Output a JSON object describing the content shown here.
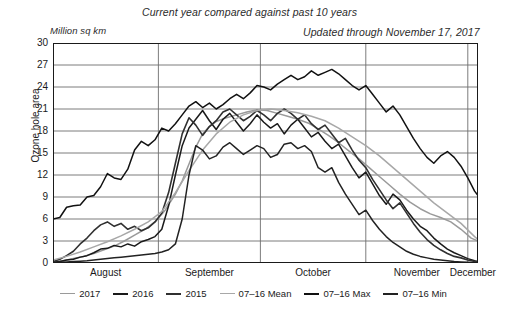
{
  "header": {
    "title": "Current year compared against past 10 years",
    "updated": "Updated through November 17, 2017",
    "unit": "Million sq km"
  },
  "axis": {
    "ylabel": "Ozone hole area",
    "yticks": [
      "30",
      "27",
      "24",
      "21",
      "18",
      "15",
      "12",
      "9",
      "6",
      "3",
      "0"
    ],
    "xticks": [
      "August",
      "September",
      "October",
      "November",
      "December"
    ]
  },
  "colors": {
    "c2017": "#9a9a9a",
    "c2016": "#1a1a1a",
    "c2015": "#303030",
    "cmean": "#a8a8a8",
    "cmax": "#111111",
    "cmin": "#222222",
    "grid": "#6e6e6e",
    "frame": "#1a1a1a"
  },
  "chart_data": {
    "type": "line",
    "title": "Current year compared against past 10 years",
    "subtitle": "Updated through November 17, 2017",
    "xlabel": "",
    "ylabel": "Ozone hole area",
    "yunit": "Million sq km",
    "ylim": [
      0,
      30
    ],
    "ytick_step": 3,
    "grid": true,
    "legend_position": "bottom",
    "x_axis_type": "day-of-year",
    "xlim": [
      0,
      125
    ],
    "month_boundaries": [
      0,
      31,
      61,
      92,
      122
    ],
    "month_labels": [
      "August",
      "September",
      "October",
      "November",
      "December"
    ],
    "series": [
      {
        "name": "2017",
        "color": "#9a9a9a",
        "x": [
          0,
          3,
          6,
          9,
          12,
          15,
          18,
          21,
          24,
          27,
          30,
          33,
          36,
          38,
          40,
          42,
          44,
          46,
          48,
          51,
          54,
          57,
          60,
          63,
          66,
          69,
          72,
          75,
          78,
          81,
          84,
          87,
          90,
          93,
          96,
          99,
          102,
          105,
          108,
          111,
          114,
          117,
          120,
          123,
          125
        ],
        "values": [
          0.2,
          0.3,
          0.6,
          0.9,
          1.3,
          1.8,
          2.3,
          3.0,
          3.8,
          4.6,
          5.6,
          7.2,
          9.4,
          11.2,
          13.5,
          15.8,
          17.6,
          18.6,
          19.3,
          19.8,
          20.2,
          20.6,
          20.9,
          20.8,
          20.4,
          20.0,
          19.6,
          19.1,
          18.3,
          17.4,
          16.4,
          15.3,
          14.2,
          13.0,
          11.8,
          10.6,
          9.4,
          8.3,
          7.4,
          6.7,
          6.2,
          5.6,
          4.6,
          3.4,
          3.0
        ]
      },
      {
        "name": "2016",
        "color": "#1a1a1a",
        "x": [
          0,
          2,
          4,
          6,
          8,
          10,
          12,
          14,
          16,
          18,
          20,
          22,
          24,
          26,
          28,
          30,
          32,
          34,
          36,
          38,
          40,
          42,
          44,
          46,
          48,
          50,
          52,
          54,
          56,
          58,
          60,
          62,
          64,
          66,
          68,
          70,
          72,
          74,
          76,
          78,
          80,
          82,
          84,
          86,
          88,
          90,
          92,
          94,
          96,
          98,
          100,
          102,
          104,
          106,
          108,
          110,
          112,
          114,
          116,
          118,
          120,
          122,
          124,
          125
        ],
        "values": [
          0.1,
          0.2,
          0.4,
          0.5,
          0.8,
          1.0,
          1.4,
          1.9,
          2.0,
          2.4,
          2.2,
          2.6,
          2.3,
          2.9,
          3.2,
          3.6,
          4.6,
          7.8,
          12.0,
          16.0,
          18.4,
          19.6,
          20.8,
          19.4,
          18.2,
          19.6,
          20.4,
          19.2,
          18.0,
          19.0,
          20.2,
          19.2,
          18.4,
          19.0,
          17.6,
          18.8,
          19.6,
          18.4,
          17.2,
          17.8,
          16.6,
          15.6,
          16.2,
          14.6,
          13.0,
          11.6,
          12.4,
          10.8,
          9.2,
          8.0,
          9.4,
          8.6,
          7.2,
          6.0,
          5.0,
          4.4,
          3.4,
          2.6,
          1.9,
          1.4,
          1.0,
          0.6,
          0.3,
          0.2
        ]
      },
      {
        "name": "2015",
        "color": "#303030",
        "x": [
          0,
          2,
          4,
          6,
          8,
          10,
          12,
          14,
          16,
          18,
          20,
          22,
          24,
          26,
          28,
          30,
          32,
          34,
          36,
          38,
          40,
          42,
          44,
          46,
          48,
          50,
          52,
          54,
          56,
          58,
          60,
          62,
          64,
          66,
          68,
          70,
          72,
          74,
          76,
          78,
          80,
          82,
          84,
          86,
          88,
          90,
          92,
          94,
          96,
          98,
          100,
          102,
          104,
          106,
          108,
          110,
          112,
          114,
          116,
          118,
          120,
          122,
          124,
          125
        ],
        "values": [
          0.2,
          0.5,
          1.0,
          1.6,
          2.6,
          3.4,
          4.4,
          5.2,
          5.6,
          5.0,
          5.4,
          4.6,
          5.0,
          4.4,
          4.8,
          5.6,
          6.8,
          9.6,
          13.6,
          17.6,
          19.8,
          18.8,
          17.4,
          18.6,
          19.4,
          20.6,
          21.0,
          20.2,
          19.4,
          20.0,
          20.8,
          20.2,
          19.4,
          20.4,
          21.0,
          20.4,
          19.6,
          20.2,
          19.0,
          18.2,
          18.8,
          17.6,
          16.4,
          17.0,
          15.4,
          14.0,
          13.0,
          11.4,
          10.0,
          8.6,
          7.4,
          8.2,
          6.8,
          5.4,
          4.2,
          3.2,
          2.4,
          1.8,
          1.3,
          0.9,
          0.7,
          0.4,
          0.2,
          0.1
        ]
      },
      {
        "name": "07-16 Mean",
        "color": "#a8a8a8",
        "x": [
          0,
          4,
          8,
          12,
          16,
          20,
          24,
          28,
          32,
          36,
          40,
          44,
          48,
          52,
          56,
          60,
          64,
          68,
          72,
          76,
          80,
          84,
          88,
          92,
          96,
          100,
          104,
          108,
          112,
          116,
          120,
          124,
          125
        ],
        "values": [
          0.4,
          0.9,
          1.5,
          2.2,
          2.9,
          3.7,
          4.6,
          5.6,
          7.0,
          9.6,
          12.6,
          15.4,
          17.6,
          19.2,
          20.2,
          20.8,
          21.0,
          20.8,
          20.5,
          20.0,
          19.4,
          18.4,
          17.2,
          16.0,
          14.6,
          13.0,
          11.4,
          9.8,
          8.2,
          6.8,
          5.4,
          3.6,
          3.2
        ]
      },
      {
        "name": "07-16 Max",
        "color": "#111111",
        "x": [
          0,
          2,
          4,
          6,
          8,
          10,
          12,
          14,
          16,
          18,
          20,
          22,
          24,
          26,
          28,
          30,
          32,
          34,
          36,
          38,
          40,
          42,
          44,
          46,
          48,
          50,
          52,
          54,
          56,
          58,
          60,
          62,
          64,
          66,
          68,
          70,
          72,
          74,
          76,
          78,
          80,
          82,
          84,
          86,
          88,
          90,
          92,
          94,
          96,
          98,
          100,
          102,
          104,
          106,
          108,
          110,
          112,
          114,
          116,
          118,
          120,
          122,
          124,
          125
        ],
        "values": [
          6.0,
          6.2,
          7.6,
          7.8,
          7.9,
          9.0,
          9.2,
          10.4,
          12.2,
          11.6,
          11.4,
          12.8,
          15.4,
          16.6,
          16.0,
          16.8,
          18.4,
          18.0,
          19.0,
          20.2,
          21.4,
          22.0,
          21.2,
          21.8,
          21.0,
          21.6,
          22.4,
          23.0,
          22.4,
          23.2,
          24.2,
          24.0,
          23.6,
          24.4,
          25.0,
          25.6,
          25.0,
          25.4,
          26.2,
          25.6,
          26.0,
          26.4,
          25.8,
          25.0,
          24.2,
          23.6,
          24.2,
          23.0,
          21.8,
          20.6,
          21.4,
          20.2,
          18.6,
          17.0,
          15.6,
          14.4,
          13.6,
          14.6,
          15.2,
          14.4,
          13.2,
          11.6,
          9.8,
          9.2
        ]
      },
      {
        "name": "07-16 Min",
        "color": "#222222",
        "x": [
          0,
          2,
          4,
          6,
          8,
          10,
          12,
          14,
          16,
          18,
          20,
          22,
          24,
          26,
          28,
          30,
          32,
          34,
          36,
          38,
          40,
          42,
          44,
          46,
          48,
          50,
          52,
          54,
          56,
          58,
          60,
          62,
          64,
          66,
          68,
          70,
          72,
          74,
          76,
          78,
          80,
          82,
          84,
          86,
          88,
          90,
          92,
          94,
          96,
          98,
          100,
          102,
          104,
          106,
          108,
          110,
          112,
          114,
          116,
          118,
          120,
          122,
          124,
          125
        ],
        "values": [
          0.05,
          0.1,
          0.15,
          0.2,
          0.25,
          0.3,
          0.4,
          0.5,
          0.6,
          0.7,
          0.8,
          0.9,
          1.0,
          1.1,
          1.2,
          1.3,
          1.5,
          1.8,
          2.6,
          6.0,
          12.0,
          16.0,
          15.4,
          14.2,
          14.6,
          15.8,
          16.4,
          15.6,
          14.8,
          15.4,
          16.0,
          15.6,
          14.4,
          14.8,
          16.2,
          16.4,
          15.6,
          16.0,
          15.2,
          13.0,
          12.4,
          13.0,
          11.0,
          9.4,
          8.0,
          6.6,
          7.2,
          5.8,
          4.6,
          3.6,
          2.8,
          2.2,
          1.6,
          1.2,
          0.9,
          0.7,
          0.5,
          0.4,
          0.3,
          0.2,
          0.15,
          0.1,
          0.05,
          0.05
        ]
      }
    ]
  },
  "legend": [
    {
      "label": "2017",
      "color": "#9a9a9a",
      "width": 1.6
    },
    {
      "label": "2016",
      "color": "#1a1a1a",
      "width": 2.2
    },
    {
      "label": "2015",
      "color": "#303030",
      "width": 2.4
    },
    {
      "label": "07-16 Mean",
      "color": "#a8a8a8",
      "width": 1.6
    },
    {
      "label": "07-16 Max",
      "color": "#111111",
      "width": 2.2
    },
    {
      "label": "07-16 Min",
      "color": "#222222",
      "width": 2.2
    }
  ]
}
